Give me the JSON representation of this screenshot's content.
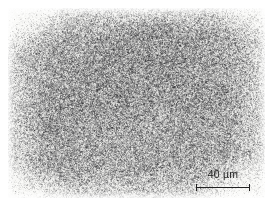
{
  "figure": {
    "type": "optical-micrograph",
    "plate": {
      "x": 8,
      "y": 8,
      "width": 257,
      "height": 190,
      "background_color": "#f4f4f2",
      "border": "none"
    },
    "page_background_color": "#ffffff"
  },
  "micrograph": {
    "texture": {
      "style": "dense-speckle-grain",
      "base_tone": "#f2f2f0",
      "grain_color": "#3a3a3a",
      "grain_density": 0.5,
      "grain_min_length": 1,
      "grain_max_length": 4,
      "contrast_note": "fine dark grain-boundary speckles over a light matrix"
    },
    "shading": {
      "vignette": "lighter toward outer edges, denser in the interior",
      "dark_cloud_regions": [
        {
          "cx": 0.56,
          "cy": 0.22,
          "rx": 0.26,
          "ry": 0.2,
          "strength": 0.42
        },
        {
          "cx": 0.42,
          "cy": 0.4,
          "rx": 0.3,
          "ry": 0.26,
          "strength": 0.22
        },
        {
          "cx": 0.74,
          "cy": 0.48,
          "rx": 0.2,
          "ry": 0.22,
          "strength": 0.2
        },
        {
          "cx": 0.2,
          "cy": 0.58,
          "rx": 0.22,
          "ry": 0.22,
          "strength": 0.14
        }
      ],
      "light_regions": [
        {
          "cx": 0.06,
          "cy": 0.06,
          "rx": 0.22,
          "ry": 0.2,
          "strength": 0.55
        },
        {
          "cx": 0.96,
          "cy": 0.04,
          "rx": 0.18,
          "ry": 0.16,
          "strength": 0.4
        },
        {
          "cx": 0.04,
          "cy": 0.96,
          "rx": 0.22,
          "ry": 0.18,
          "strength": 0.45
        },
        {
          "cx": 0.92,
          "cy": 0.94,
          "rx": 0.24,
          "ry": 0.2,
          "strength": 0.5
        }
      ]
    }
  },
  "scale_bar": {
    "label": "40 µm",
    "value": 40,
    "unit": "µm",
    "bar_length_px": 54,
    "position": {
      "left": 190,
      "top": 168
    },
    "color": "#222222",
    "tick_height_px": 7,
    "label_font_size_px": 10.5
  }
}
